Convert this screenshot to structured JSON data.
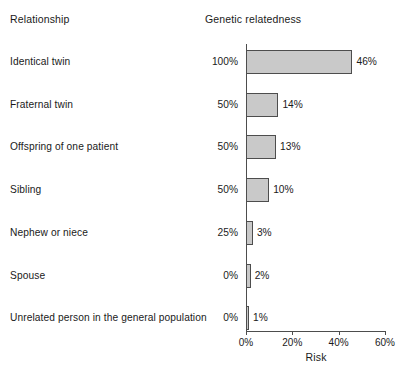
{
  "header": {
    "relationship_label": "Relationship",
    "genetic_label": "Genetic  relatedness"
  },
  "axis": {
    "title": "Risk",
    "ticks": [
      "0%",
      "20%",
      "40%",
      "60%"
    ]
  },
  "colors": {
    "bar_fill": "#c9c9c9",
    "bar_stroke": "#4d4d4d",
    "text": "#1a1a1a",
    "axis": "#4d4d4d",
    "background": "#ffffff"
  },
  "chart_data": {
    "type": "bar",
    "orientation": "horizontal",
    "title": "",
    "xlabel": "Risk",
    "ylabel": "Relationship",
    "xlim": [
      0,
      60
    ],
    "xticks": [
      0,
      20,
      40,
      60
    ],
    "xtick_labels": [
      "0%",
      "20%",
      "40%",
      "60%"
    ],
    "grid": false,
    "legend": false,
    "categories": [
      "Identical twin",
      "Fraternal twin",
      "Offspring of one patient",
      "Sibling",
      "Nephew or niece",
      "Spouse",
      "Unrelated person in the general population"
    ],
    "values": [
      46,
      14,
      13,
      10,
      3,
      2,
      1
    ],
    "value_labels": [
      "46%",
      "14%",
      "13%",
      "10%",
      "3%",
      "2%",
      "1%"
    ],
    "genetic_relatedness": [
      100,
      50,
      50,
      50,
      25,
      0,
      0
    ],
    "genetic_relatedness_labels": [
      "100%",
      "50%",
      "50%",
      "50%",
      "25%",
      "0%",
      "0%"
    ],
    "series": [
      {
        "name": "Risk",
        "values": [
          46,
          14,
          13,
          10,
          3,
          2,
          1
        ]
      }
    ]
  },
  "rows": [
    {
      "label": "Identical twin",
      "relatedness": "100%",
      "value_label": "46%",
      "value": 46
    },
    {
      "label": "Fraternal twin",
      "relatedness": "50%",
      "value_label": "14%",
      "value": 14
    },
    {
      "label": "Offspring of one patient",
      "relatedness": "50%",
      "value_label": "13%",
      "value": 13
    },
    {
      "label": "Sibling",
      "relatedness": "50%",
      "value_label": "10%",
      "value": 10
    },
    {
      "label": "Nephew or niece",
      "relatedness": "25%",
      "value_label": "3%",
      "value": 3
    },
    {
      "label": "Spouse",
      "relatedness": "0%",
      "value_label": "2%",
      "value": 2
    },
    {
      "label": "Unrelated person in the general population",
      "relatedness": "0%",
      "value_label": "1%",
      "value": 1
    }
  ]
}
